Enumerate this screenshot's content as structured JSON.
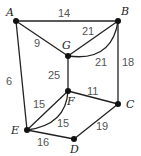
{
  "graph": {
    "nodes": [
      {
        "id": "A",
        "label": "A",
        "x": 16,
        "y": 21,
        "lx": 6,
        "ly": 16
      },
      {
        "id": "B",
        "label": "B",
        "x": 118,
        "y": 21,
        "lx": 121,
        "ly": 15
      },
      {
        "id": "G",
        "label": "G",
        "x": 68,
        "y": 56,
        "lx": 62,
        "ly": 49
      },
      {
        "id": "F",
        "label": "F",
        "x": 68,
        "y": 91,
        "lx": 67,
        "ly": 105
      },
      {
        "id": "C",
        "label": "C",
        "x": 118,
        "y": 104,
        "lx": 126,
        "ly": 108
      },
      {
        "id": "E",
        "label": "E",
        "x": 27,
        "y": 130,
        "lx": 11,
        "ly": 134
      },
      {
        "id": "D",
        "label": "D",
        "x": 74,
        "y": 139,
        "lx": 70,
        "ly": 153
      }
    ],
    "edges": [
      {
        "from": "A",
        "to": "B",
        "weight": "14",
        "lx": 58,
        "ly": 17,
        "curve": false
      },
      {
        "from": "A",
        "to": "G",
        "weight": "9",
        "lx": 34,
        "ly": 47,
        "curve": false
      },
      {
        "from": "G",
        "to": "B",
        "weight": "21",
        "lx": 82,
        "ly": 35,
        "curve": false
      },
      {
        "from": "G",
        "to": "B",
        "weight": "21",
        "lx": 95,
        "ly": 66,
        "curve": true,
        "path": "M68,56 Q112,62 118,21"
      },
      {
        "from": "B",
        "to": "C",
        "weight": "18",
        "lx": 122,
        "ly": 66,
        "curve": false
      },
      {
        "from": "A",
        "to": "E",
        "weight": "6",
        "lx": 6,
        "ly": 85,
        "curve": false
      },
      {
        "from": "G",
        "to": "F",
        "weight": "25",
        "lx": 48,
        "ly": 79,
        "curve": false
      },
      {
        "from": "F",
        "to": "C",
        "weight": "11",
        "lx": 87,
        "ly": 95,
        "curve": false
      },
      {
        "from": "E",
        "to": "F",
        "weight": "15",
        "lx": 33,
        "ly": 108,
        "curve": false
      },
      {
        "from": "E",
        "to": "F",
        "weight": "15",
        "lx": 57,
        "ly": 127,
        "curve": true,
        "path": "M27,130 Q66,125 68,91"
      },
      {
        "from": "E",
        "to": "D",
        "weight": "16",
        "lx": 37,
        "ly": 146,
        "curve": false
      },
      {
        "from": "D",
        "to": "C",
        "weight": "19",
        "lx": 96,
        "ly": 130,
        "curve": false
      }
    ]
  }
}
